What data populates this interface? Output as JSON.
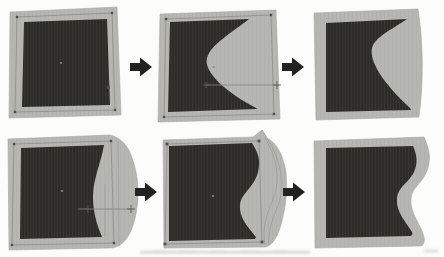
{
  "figure": {
    "kind": "scanned-paper-figure",
    "grid": {
      "rows": 2,
      "columns": 3
    },
    "rows": [
      {
        "name": "top-row",
        "panels": [
          {
            "name": "solid-square-initial"
          },
          {
            "name": "square-with-curve-cut-and-control-cage"
          },
          {
            "name": "curve-cut-result"
          }
        ],
        "arrow_icons": 2
      },
      {
        "name": "bottom-row",
        "panels": [
          {
            "name": "square-with-bulged-edge-and-control-handle"
          },
          {
            "name": "square-with-s-wave-edit-and-control-cage"
          },
          {
            "name": "s-wave-result"
          }
        ],
        "arrow_icons": 2
      }
    ],
    "icons": [
      {
        "name": "right-arrow-icon",
        "glyph": "➡",
        "count": 4
      }
    ],
    "caption": {
      "legible": false,
      "note_text": ""
    }
  },
  "colors": {
    "page_bg": "#fcfcfb",
    "panel_gray": "#b6b6b3",
    "panel_gray_stripe": "#b1b1ae",
    "panel_gray_edge": "#a7a7a3",
    "shape_dark": "#2c2b28",
    "shape_dark_stripe": "#37362f",
    "cage_line": "#8c8c88",
    "cage_marker": "#504f4b",
    "control_line": "#85847f",
    "control_marker": "#5f5e58",
    "center_dot": "#8a8a85",
    "arrow_black": "#232220",
    "caption_remnant": "#c4c4c1"
  }
}
